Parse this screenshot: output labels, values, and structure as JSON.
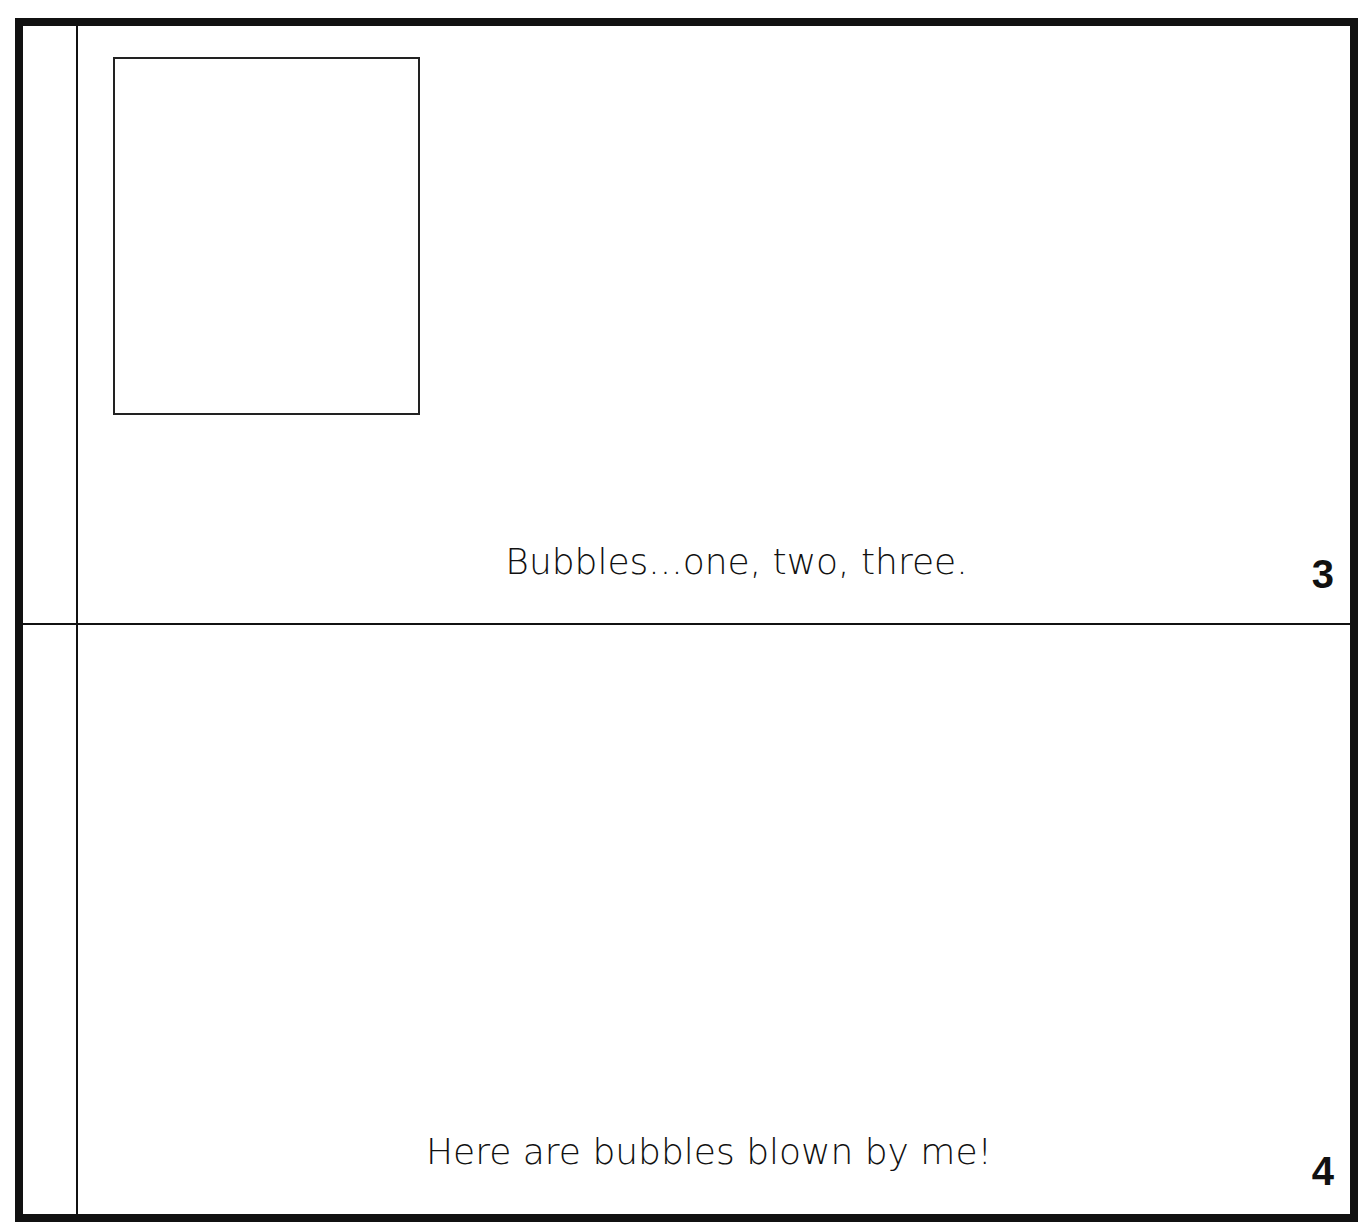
{
  "document": {
    "type": "mini-book printable page",
    "pages": [
      {
        "page_number": "3",
        "caption": "Bubbles...one, two, three.",
        "has_picture_box": true
      },
      {
        "page_number": "4",
        "caption": "Here are bubbles blown by me!",
        "has_picture_box": false
      }
    ]
  },
  "colors": {
    "ink": "#111111",
    "paper": "#ffffff"
  }
}
